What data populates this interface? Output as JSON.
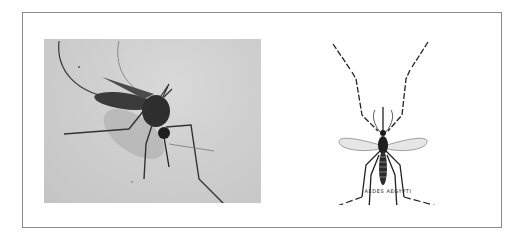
{
  "figure": {
    "left_panel": {
      "type": "photograph",
      "subject": "mosquito resting on skin",
      "tone": "grayscale"
    },
    "right_panel": {
      "type": "illustration",
      "subject": "mosquito dorsal view",
      "caption": "AEDES AEGYPTI"
    }
  },
  "colors": {
    "frame_border": "#8a8a8a",
    "background": "#ffffff",
    "photo_background": "#cfcfcf",
    "ink": "#222222"
  }
}
